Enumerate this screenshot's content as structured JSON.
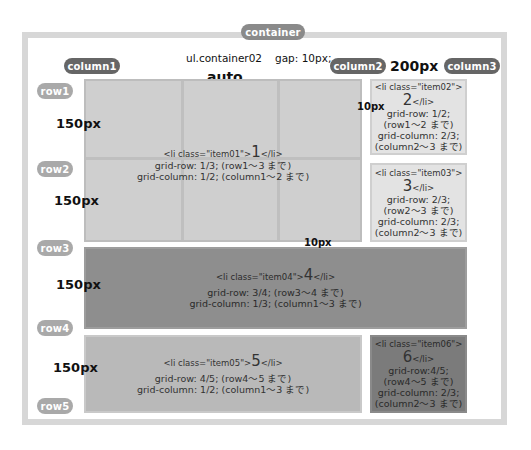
{
  "diagram": {
    "container_label": "container",
    "selector_label": "ul.container02",
    "gap_label": "gap: 10px;",
    "column_width_auto": "auto",
    "column_width_fixed": "200px",
    "gap_vertical_label": "10px",
    "gap_horizontal_label": "10px",
    "columns": [
      {
        "label": "column1"
      },
      {
        "label": "column2"
      },
      {
        "label": "column3"
      }
    ],
    "rows": [
      {
        "label": "row1"
      },
      {
        "label": "row2"
      },
      {
        "label": "row3"
      },
      {
        "label": "row4"
      },
      {
        "label": "row5"
      }
    ],
    "row_heights": [
      "150px",
      "150px",
      "150px",
      "150px"
    ],
    "items": [
      {
        "tag_open": "<li class=\"item01\">",
        "number": "1",
        "tag_close": "</li>",
        "lines": [
          "grid-row: 1/3; (row1〜3 まで)",
          "grid-column: 1/2; (column1〜2 まで)"
        ]
      },
      {
        "tag_open": "<li class=\"item02\">",
        "number": "2",
        "tag_close": "</li>",
        "lines": [
          "grid-row: 1/2;",
          "(row1〜2 まで)",
          "grid-column: 2/3;",
          "(column2〜3 まで)"
        ]
      },
      {
        "tag_open": "<li class=\"item03\">",
        "number": "3",
        "tag_close": "</li>",
        "lines": [
          "grid-row: 2/3;",
          "(row2〜3 まで)",
          "grid-column: 2/3;",
          "(column2〜3 まで)"
        ]
      },
      {
        "tag_open": "<li class=\"item04\">",
        "number": "4",
        "tag_close": "</li>",
        "lines": [
          "grid-row: 3/4; (row3〜4 まで)",
          "grid-column: 1/3; (column1〜3 まで)"
        ]
      },
      {
        "tag_open": "<li class=\"item05\">",
        "number": "5",
        "tag_close": "</li>",
        "lines": [
          "grid-row: 4/5; (row4〜5 まで)",
          "grid-column: 1/2; (column1〜3 まで)"
        ]
      },
      {
        "tag_open": "<li class=\"item06\">",
        "number": "6",
        "tag_close": "</li>",
        "lines": [
          "grid-row:4/5;",
          "(row4〜5 まで)",
          "grid-column: 2/3;",
          "(column2〜3 まで)"
        ]
      }
    ],
    "colors": {
      "container_border": "#d7d7d7",
      "pill_dark": "#666666",
      "pill_light": "#a9a9a9",
      "item01": "#cfcfcf",
      "item02": "#e3e3e3",
      "item03": "#e3e3e3",
      "item04": "#8e8e8e",
      "item05": "#b9b9b9",
      "item06": "#7b7b7b"
    }
  }
}
